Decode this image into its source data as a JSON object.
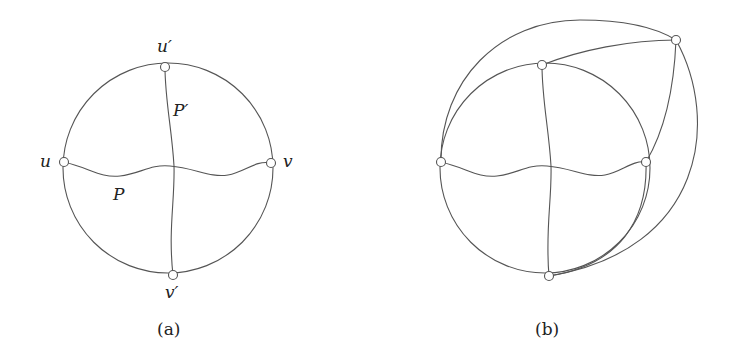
{
  "figure": {
    "panel_a": {
      "caption": "(a)",
      "vertex_labels": {
        "u": "u",
        "v": "v",
        "u_prime": "u′",
        "v_prime": "v′"
      },
      "path_labels": {
        "P": "P",
        "P_prime": "P′"
      }
    },
    "panel_b": {
      "caption": "(b)"
    }
  }
}
